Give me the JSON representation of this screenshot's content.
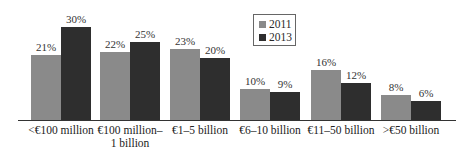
{
  "chart_data": {
    "type": "bar",
    "title": "",
    "xlabel": "",
    "ylabel": "",
    "ylim": [
      0,
      32
    ],
    "grid": false,
    "legend_position": "top-center-right",
    "categories": [
      "<€100 million",
      "€100 million–\n1 billion",
      "€1–5 billion",
      "€6–10 billion",
      "€11–50 billion",
      ">€50 billion"
    ],
    "category_lines": [
      [
        "<€100 million"
      ],
      [
        "€100 million–",
        "1 billion"
      ],
      [
        "€1–5 billion"
      ],
      [
        "€6–10 billion"
      ],
      [
        "€11–50 billion"
      ],
      [
        ">€50 billion"
      ]
    ],
    "series": [
      {
        "name": "2011",
        "color": "#8a8a8a",
        "values": [
          21,
          22,
          23,
          10,
          16,
          8
        ],
        "labels": [
          "21%",
          "22%",
          "23%",
          "10%",
          "16%",
          "8%"
        ]
      },
      {
        "name": "2013",
        "color": "#2e2e2e",
        "values": [
          30,
          25,
          20,
          9,
          12,
          6
        ],
        "labels": [
          "30%",
          "25%",
          "20%",
          "9%",
          "12%",
          "6%"
        ]
      }
    ]
  },
  "legend": {
    "items": [
      {
        "label": "2011",
        "color": "#8a8a8a"
      },
      {
        "label": "2013",
        "color": "#2e2e2e"
      }
    ]
  }
}
